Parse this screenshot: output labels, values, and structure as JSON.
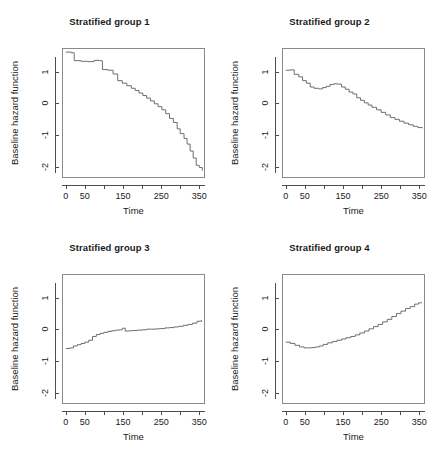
{
  "figure": {
    "layout": "2x2 grid of step plots",
    "background": "#ffffff",
    "line_color": "#6e6e6e",
    "axis_color": "#4d4d4d",
    "text_color": "#1a1a1a"
  },
  "axis": {
    "xlabel": "Time",
    "ylabel": "Baseline hazard function",
    "x_tick_values": [
      0,
      50,
      100,
      150,
      200,
      250,
      300,
      350
    ],
    "x_tick_labels": [
      "0",
      "50",
      "",
      "150",
      "",
      "250",
      "",
      "350"
    ],
    "y_tick_values": [
      1,
      0,
      -1,
      -2
    ],
    "y_tick_labels": [
      "1",
      "0",
      "-1",
      "-2"
    ],
    "xlim": [
      -10,
      365
    ],
    "ylim": [
      -2.35,
      1.75
    ]
  },
  "chart_data": [
    {
      "type": "line",
      "title": "Stratified group 1",
      "xlabel": "Time",
      "ylabel": "Baseline hazard function",
      "xlim": [
        -10,
        365
      ],
      "ylim": [
        -2.35,
        1.75
      ],
      "grid": false,
      "legend": "none",
      "step": "hv",
      "x": [
        0,
        14,
        22,
        40,
        58,
        74,
        88,
        96,
        110,
        124,
        136,
        148,
        160,
        172,
        182,
        192,
        202,
        212,
        222,
        232,
        242,
        252,
        262,
        272,
        282,
        292,
        300,
        310,
        318,
        326,
        334,
        342,
        350,
        358
      ],
      "y": [
        1.62,
        1.6,
        1.35,
        1.33,
        1.32,
        1.36,
        1.35,
        1.07,
        1.05,
        0.93,
        0.72,
        0.64,
        0.56,
        0.48,
        0.41,
        0.33,
        0.25,
        0.17,
        0.08,
        -0.01,
        -0.1,
        -0.2,
        -0.32,
        -0.47,
        -0.6,
        -0.8,
        -0.95,
        -1.1,
        -1.28,
        -1.5,
        -1.72,
        -1.95,
        -2.02,
        -2.12
      ]
    },
    {
      "type": "line",
      "title": "Stratified group 2",
      "xlabel": "Time",
      "ylabel": "Baseline hazard function",
      "xlim": [
        -10,
        365
      ],
      "ylim": [
        -2.35,
        1.75
      ],
      "grid": false,
      "legend": "none",
      "step": "hv",
      "x": [
        0,
        12,
        22,
        34,
        44,
        54,
        64,
        74,
        86,
        96,
        106,
        116,
        126,
        136,
        146,
        156,
        166,
        176,
        186,
        196,
        206,
        216,
        226,
        238,
        250,
        262,
        274,
        286,
        298,
        310,
        322,
        334,
        346,
        358
      ],
      "y": [
        1.05,
        1.06,
        0.92,
        0.84,
        0.72,
        0.64,
        0.52,
        0.48,
        0.46,
        0.5,
        0.54,
        0.6,
        0.62,
        0.61,
        0.52,
        0.45,
        0.36,
        0.3,
        0.18,
        0.1,
        0.02,
        -0.05,
        -0.12,
        -0.2,
        -0.28,
        -0.36,
        -0.44,
        -0.5,
        -0.56,
        -0.62,
        -0.67,
        -0.72,
        -0.76,
        -0.78
      ]
    },
    {
      "type": "line",
      "title": "Stratified group 3",
      "xlabel": "Time",
      "ylabel": "Baseline hazard function",
      "xlim": [
        -10,
        365
      ],
      "ylim": [
        -2.35,
        1.75
      ],
      "grid": false,
      "legend": "none",
      "step": "hv",
      "x": [
        0,
        10,
        20,
        30,
        40,
        50,
        60,
        70,
        80,
        90,
        100,
        110,
        120,
        130,
        140,
        148,
        156,
        166,
        176,
        188,
        200,
        212,
        224,
        236,
        248,
        260,
        272,
        284,
        296,
        308,
        320,
        332,
        344,
        356
      ],
      "y": [
        -0.6,
        -0.58,
        -0.52,
        -0.48,
        -0.44,
        -0.4,
        -0.34,
        -0.22,
        -0.16,
        -0.12,
        -0.09,
        -0.06,
        -0.04,
        -0.02,
        -0.01,
        0.04,
        -0.05,
        -0.04,
        -0.03,
        -0.02,
        -0.01,
        0.01,
        0.01,
        0.02,
        0.03,
        0.05,
        0.06,
        0.08,
        0.1,
        0.13,
        0.16,
        0.2,
        0.26,
        0.3
      ]
    },
    {
      "type": "line",
      "title": "Stratified group 4",
      "xlabel": "Time",
      "ylabel": "Baseline hazard function",
      "xlim": [
        -10,
        365
      ],
      "ylim": [
        -2.35,
        1.75
      ],
      "grid": false,
      "legend": "none",
      "step": "hv",
      "x": [
        0,
        12,
        24,
        36,
        48,
        58,
        68,
        78,
        88,
        98,
        110,
        122,
        134,
        146,
        158,
        170,
        182,
        194,
        206,
        218,
        230,
        242,
        254,
        266,
        278,
        290,
        302,
        314,
        326,
        338,
        348,
        356
      ],
      "y": [
        -0.4,
        -0.44,
        -0.5,
        -0.55,
        -0.58,
        -0.58,
        -0.57,
        -0.55,
        -0.52,
        -0.47,
        -0.42,
        -0.38,
        -0.34,
        -0.3,
        -0.26,
        -0.22,
        -0.17,
        -0.11,
        -0.05,
        0.02,
        0.09,
        0.16,
        0.24,
        0.32,
        0.41,
        0.5,
        0.58,
        0.66,
        0.72,
        0.8,
        0.84,
        0.86
      ]
    }
  ]
}
